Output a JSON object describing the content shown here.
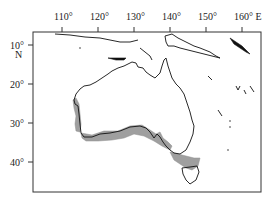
{
  "map": {
    "region": "Australia",
    "x_axis": {
      "ticks": [
        {
          "value": 110,
          "label": "110°"
        },
        {
          "value": 120,
          "label": "120°"
        },
        {
          "value": 130,
          "label": "130°"
        },
        {
          "value": 140,
          "label": "140°"
        },
        {
          "value": 150,
          "label": "150°"
        },
        {
          "value": 160,
          "label": "160° E"
        }
      ]
    },
    "y_axis": {
      "ticks": [
        {
          "value": 10,
          "label": "10°"
        },
        {
          "value": 20,
          "label": "20°"
        },
        {
          "value": 30,
          "label": "30°"
        },
        {
          "value": 40,
          "label": "40°"
        }
      ],
      "hemisphere_label": "N"
    },
    "shaded_region": {
      "description": "distribution range along southern and south-western coast including Tasmania",
      "color": "#9a9a9a"
    },
    "colors": {
      "coastline": "#111111",
      "frame": "#333333",
      "background": "#ffffff"
    }
  }
}
